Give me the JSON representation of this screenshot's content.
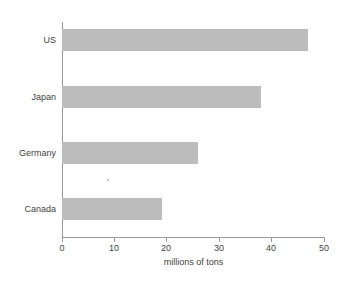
{
  "chart_data": {
    "type": "bar",
    "orientation": "horizontal",
    "title": "",
    "subtitle": "",
    "categories": [
      "US",
      "Japan",
      "Germany",
      "Canada"
    ],
    "values": [
      47,
      38,
      26,
      19
    ],
    "xlabel": "millions of tons",
    "ylabel": "",
    "xlim": [
      0,
      50
    ],
    "xticks": [
      0,
      10,
      20,
      30,
      40,
      50
    ],
    "xtick_labels": [
      "0",
      "10",
      "20",
      "30",
      "40",
      "50"
    ],
    "grid": false,
    "legend": null,
    "bar_color": "#bcbcbc",
    "axis_color": "#9a9a9a",
    "background": "#ffffff"
  },
  "figure": {
    "name": "horizontal-bar-chart",
    "axis_title": "millions of tons"
  }
}
